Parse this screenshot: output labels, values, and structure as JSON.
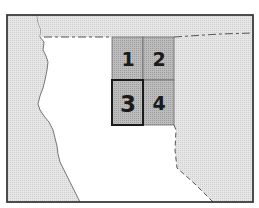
{
  "map": {
    "type": "locator map",
    "colors": {
      "background": "#ffffff",
      "land_shaded": "#e2e2e2",
      "grid_fill": "#b4b4b4",
      "frame": "#3a3a3a",
      "grid_line": "#555555",
      "highlight_border": "#1a1a1a"
    },
    "grid_cells": [
      {
        "id": "1",
        "label": "1",
        "highlighted": false
      },
      {
        "id": "2",
        "label": "2",
        "highlighted": false
      },
      {
        "id": "3",
        "label": "3",
        "highlighted": true
      },
      {
        "id": "4",
        "label": "4",
        "highlighted": false
      }
    ]
  }
}
